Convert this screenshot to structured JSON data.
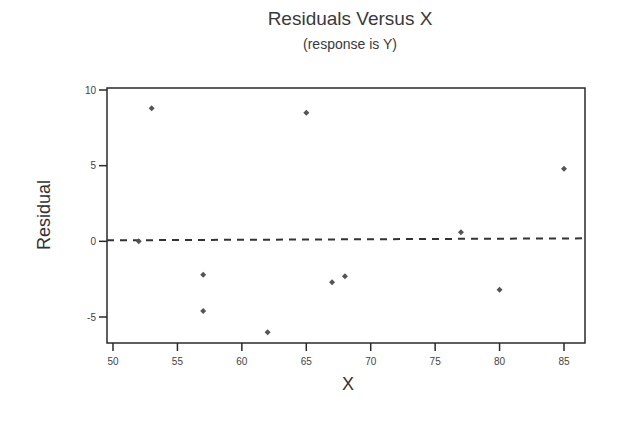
{
  "chart_data": {
    "type": "scatter",
    "title": "Residuals Versus X",
    "subtitle": "(response is Y)",
    "xlabel": "X",
    "ylabel": "Residual",
    "xlim": [
      49.5,
      86.7
    ],
    "ylim": [
      -6.7,
      10.1
    ],
    "xticks": [
      50,
      55,
      60,
      65,
      70,
      75,
      80,
      85
    ],
    "yticks": [
      -5,
      0,
      5,
      10
    ],
    "grid": false,
    "legend": null,
    "reference_line": {
      "y": 0,
      "style": "dashed"
    },
    "points": [
      {
        "x": 52,
        "y": 0.0
      },
      {
        "x": 53,
        "y": 8.8
      },
      {
        "x": 57,
        "y": -2.2
      },
      {
        "x": 57,
        "y": -4.6
      },
      {
        "x": 62,
        "y": -6.0
      },
      {
        "x": 65,
        "y": 8.5
      },
      {
        "x": 67,
        "y": -2.7
      },
      {
        "x": 68,
        "y": -2.3
      },
      {
        "x": 77,
        "y": 0.6
      },
      {
        "x": 80,
        "y": -3.2
      },
      {
        "x": 85,
        "y": 4.8
      }
    ]
  },
  "colors": {
    "axis": "#2a2a2a",
    "point": "#555555",
    "refline": "#333333"
  }
}
